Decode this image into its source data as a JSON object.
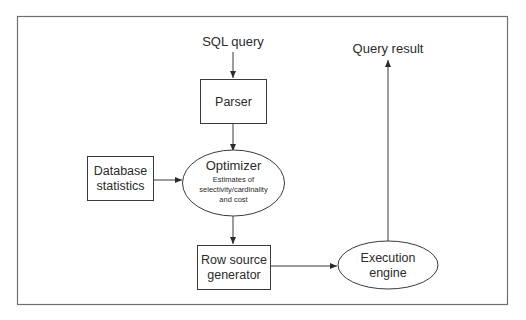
{
  "diagram": {
    "nodes": {
      "input": {
        "label": "SQL query"
      },
      "parser": {
        "label": "Parser"
      },
      "db_stats": {
        "line1": "Database",
        "line2": "statistics"
      },
      "optimizer": {
        "title": "Optimizer",
        "line1": "Estimates of",
        "line2": "selectivity/cardinality",
        "line3": "and cost"
      },
      "row_source": {
        "line1": "Row source",
        "line2": "generator"
      },
      "execution": {
        "line1": "Execution",
        "line2": "engine"
      },
      "output": {
        "label": "Query result"
      }
    },
    "edges": [
      {
        "from": "SQL query",
        "to": "Parser"
      },
      {
        "from": "Parser",
        "to": "Optimizer"
      },
      {
        "from": "Database statistics",
        "to": "Optimizer"
      },
      {
        "from": "Optimizer",
        "to": "Row source generator"
      },
      {
        "from": "Row source generator",
        "to": "Execution engine"
      },
      {
        "from": "Execution engine",
        "to": "Query result"
      }
    ],
    "colors": {
      "stroke": "#3a3a3a",
      "frame": "#6e6e6e",
      "text": "#2b2b2b",
      "background": "#ffffff"
    }
  }
}
